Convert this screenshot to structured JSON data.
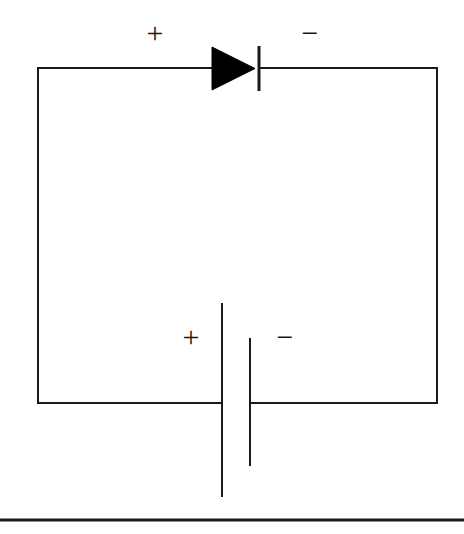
{
  "figure": {
    "kind": "schematic-circuit-diagram",
    "background_color": "#ffffff",
    "line_color": "#1a1a1a",
    "fill_color": "#000000",
    "width": 464,
    "height": 534
  },
  "labels": {
    "diode_anode_polarity": "+",
    "diode_cathode_polarity": "−",
    "battery_positive_polarity": "+",
    "battery_negative_polarity": "−"
  },
  "components": {
    "loop_wire": {
      "name": "closed-circuit-loop",
      "left_x": 38,
      "right_x": 437,
      "top_y": 68,
      "bottom_y": 403,
      "stroke_width": 2
    },
    "diode": {
      "name": "diode",
      "orientation": "pointing-right",
      "triangle_left_x": 212,
      "triangle_right_x": 255,
      "triangle_top_y": 47,
      "triangle_bottom_y": 90,
      "cathode_bar_x": 259,
      "cathode_bar_top_y": 46,
      "cathode_bar_bottom_y": 91,
      "cathode_bar_width": 3
    },
    "battery": {
      "name": "battery",
      "long_plate_x": 222,
      "long_plate_top_y": 303,
      "long_plate_bottom_y": 497,
      "short_plate_x": 250,
      "short_plate_top_y": 338,
      "short_plate_bottom_y": 466,
      "plate_stroke_width": 2
    },
    "footer_rule": {
      "name": "footer-rule",
      "x1": 0,
      "x2": 464,
      "y": 520,
      "stroke_width": 3
    }
  }
}
